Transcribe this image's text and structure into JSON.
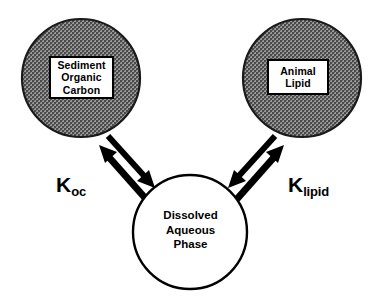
{
  "diagram": {
    "background_color": "#ffffff",
    "line_color": "#000000",
    "shaded_fill_color": "#808080",
    "nodes": [
      {
        "id": "sediment-organic-carbon",
        "shape": "circle",
        "fill": "shaded",
        "label_lines": [
          "Sediment",
          "Organic",
          "Carbon"
        ],
        "line1": "Sediment",
        "line2": "Organic",
        "line3": "Carbon"
      },
      {
        "id": "animal-lipid",
        "shape": "circle",
        "fill": "shaded",
        "label_lines": [
          "Animal",
          "Lipid"
        ],
        "line1": "Animal",
        "line2": "Lipid"
      },
      {
        "id": "dissolved-aqueous-phase",
        "shape": "circle",
        "fill": "white",
        "label_lines": [
          "Dissolved",
          "Aqueous",
          "Phase"
        ],
        "line1": "Dissolved",
        "line2": "Aqueous",
        "line3": "Phase"
      }
    ],
    "connectors": [
      {
        "id": "k-oc",
        "from": "sediment-organic-carbon",
        "to": "dissolved-aqueous-phase",
        "style": "double-headed",
        "symbol": "K",
        "subscript": "oc"
      },
      {
        "id": "k-lipid",
        "from": "animal-lipid",
        "to": "dissolved-aqueous-phase",
        "style": "double-headed",
        "symbol": "K",
        "subscript": "lipid"
      }
    ]
  }
}
